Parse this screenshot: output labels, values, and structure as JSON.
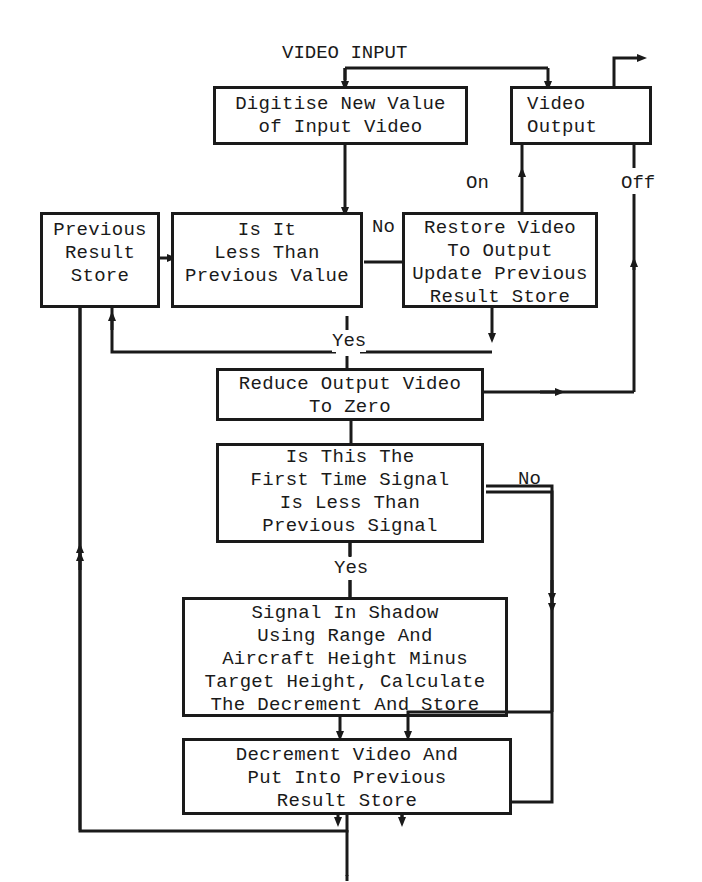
{
  "diagram": {
    "input_label": "VIDEO INPUT",
    "nodes": {
      "digitise": {
        "lines": [
          "Digitise New Value",
          "of Input Video"
        ]
      },
      "video_output": {
        "lines": [
          "Video",
          "Output"
        ]
      },
      "previous_store": {
        "lines": [
          "Previous",
          "Result",
          "Store"
        ]
      },
      "compare": {
        "lines": [
          "Is It",
          "Less Than",
          "Previous Value"
        ]
      },
      "restore": {
        "lines": [
          "Restore Video",
          "To Output",
          "Update Previous",
          "Result Store"
        ]
      },
      "reduce": {
        "lines": [
          "Reduce Output Video",
          "To Zero"
        ]
      },
      "first_time": {
        "lines": [
          "Is This The",
          "First Time Signal",
          "Is Less Than",
          "Previous Signal"
        ]
      },
      "shadow": {
        "lines": [
          "Signal In Shadow",
          "Using Range And",
          "Aircraft Height Minus",
          "Target Height, Calculate",
          "The Decrement And Store"
        ]
      },
      "decrement": {
        "lines": [
          "Decrement Video And",
          "Put Into Previous",
          "Result Store"
        ]
      }
    },
    "edge_labels": {
      "compare_no": "No",
      "compare_yes": "Yes",
      "output_on": "On",
      "output_off": "Off",
      "first_no": "No",
      "first_yes": "Yes"
    },
    "colors": {
      "ink": "#1a1a1a",
      "paper": "#ffffff"
    }
  }
}
